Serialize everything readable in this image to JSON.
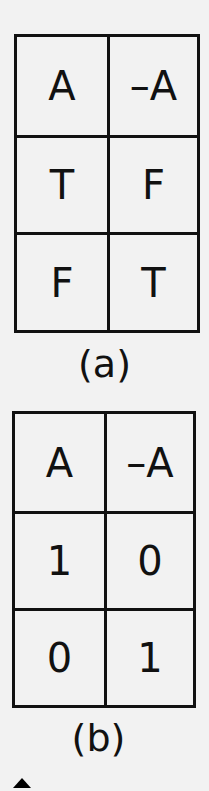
{
  "tables": [
    {
      "caption": "(a)",
      "headers": [
        "A",
        "–A"
      ],
      "rows": [
        [
          "T",
          "F"
        ],
        [
          "F",
          "T"
        ]
      ]
    },
    {
      "caption": "(b)",
      "headers": [
        "A",
        "–A"
      ],
      "rows": [
        [
          "1",
          "0"
        ],
        [
          "0",
          "1"
        ]
      ]
    }
  ],
  "icons": {
    "scroll_up": "triangle-up-icon"
  }
}
